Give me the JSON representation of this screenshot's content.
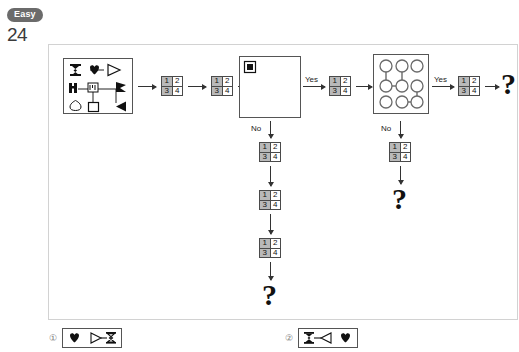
{
  "header": {
    "difficulty": "Easy",
    "number": "24"
  },
  "panel": {
    "branch_labels": {
      "yes": "Yes",
      "no": "No"
    },
    "question_mark": "?"
  },
  "numgrid": {
    "cells": [
      "1",
      "2",
      "3",
      "4"
    ],
    "shaded": [
      true,
      false,
      true,
      false
    ]
  },
  "symbols": {
    "hourglass": "hourglass-symbol",
    "heart": "heart-symbol",
    "triangle_right": "triangle-right-symbol",
    "bracket_left": "bracket-left-symbol",
    "bracket_small": "bracket-small-symbol",
    "flag": "flag-symbol",
    "drop": "drop-symbol",
    "square": "square-symbol",
    "triangle_left": "triangle-left-symbol"
  },
  "big_box": {
    "icon": "filled-square-icon"
  },
  "circle_grid": {
    "rows": 3,
    "cols": 3,
    "connections": [
      "top-left-to-mid-left",
      "top-mid-to-mid-mid",
      "mid-left-to-mid-mid",
      "mid-right-to-bottom-right",
      "bottom-mid-to-bottom-right"
    ]
  },
  "options": [
    {
      "number": "①",
      "items": [
        "heart-symbol",
        "triangle-right-symbol",
        "hourglass-symbol"
      ]
    },
    {
      "number": "②",
      "items": [
        "hourglass-symbol",
        "triangle-left-symbol",
        "heart-symbol"
      ]
    }
  ],
  "colors": {
    "badge_bg": "#6b6b6b",
    "panel_border": "#d2d2d2",
    "shade": "#b9b9b9",
    "ink": "#111111"
  }
}
